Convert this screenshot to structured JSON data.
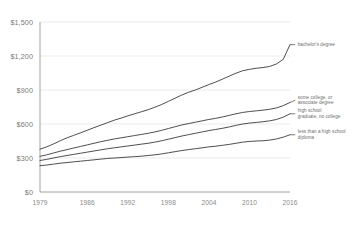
{
  "chart_data": {
    "type": "line",
    "title": "",
    "subtitle": "",
    "xlabel": "",
    "ylabel": "",
    "grid": true,
    "legend_position": "inline-right",
    "xlim": [
      1979,
      2016
    ],
    "ylim": [
      0,
      1500
    ],
    "y_ticks": [
      0,
      300,
      600,
      900,
      1200,
      1500
    ],
    "y_tick_labels": [
      "$0",
      "$300",
      "$600",
      "$900",
      "$1,200",
      "$1,500"
    ],
    "x_ticks": [
      1979,
      1986,
      1992,
      1998,
      2004,
      2010,
      2016
    ],
    "x_tick_labels": [
      "1979",
      "1986",
      "1992",
      "1998",
      "2004",
      "2010",
      "2016"
    ],
    "x": [
      1979,
      1980,
      1981,
      1982,
      1983,
      1984,
      1985,
      1986,
      1987,
      1988,
      1989,
      1990,
      1991,
      1992,
      1993,
      1994,
      1995,
      1996,
      1997,
      1998,
      1999,
      2000,
      2001,
      2002,
      2003,
      2004,
      2005,
      2006,
      2007,
      2008,
      2009,
      2010,
      2011,
      2012,
      2013,
      2014,
      2015,
      2016
    ],
    "series": [
      {
        "name": "bachelor's degree",
        "label": "bachelor's degree",
        "color": "#3a3a3a",
        "label_x": 2017.0,
        "label_y": 1300,
        "values": [
          378,
          398,
          424,
          452,
          478,
          500,
          522,
          545,
          568,
          590,
          612,
          634,
          652,
          672,
          690,
          708,
          726,
          748,
          772,
          800,
          828,
          856,
          880,
          900,
          924,
          948,
          970,
          996,
          1022,
          1048,
          1070,
          1082,
          1092,
          1098,
          1108,
          1130,
          1170,
          1300
        ]
      },
      {
        "name": "some college, or associate degree",
        "label": "some college, or associate degree",
        "color": "#3a3a3a",
        "label_x": 2017.0,
        "label_y": 810,
        "values": [
          315,
          328,
          344,
          360,
          374,
          388,
          402,
          416,
          430,
          444,
          456,
          468,
          478,
          488,
          498,
          508,
          518,
          530,
          544,
          560,
          576,
          592,
          604,
          616,
          628,
          640,
          650,
          662,
          676,
          690,
          702,
          710,
          716,
          722,
          730,
          742,
          762,
          790
        ]
      },
      {
        "name": "high school graduate, no college",
        "label": "high school graduate, no college",
        "color": "#3a3a3a",
        "label_x": 2017.0,
        "label_y": 690,
        "values": [
          278,
          288,
          300,
          312,
          322,
          332,
          342,
          352,
          362,
          372,
          382,
          390,
          398,
          406,
          414,
          422,
          430,
          440,
          452,
          466,
          480,
          494,
          506,
          518,
          530,
          542,
          552,
          562,
          574,
          588,
          600,
          608,
          614,
          620,
          628,
          640,
          660,
          690
        ]
      },
      {
        "name": "less than a high school diploma",
        "label": "less than a high school diploma",
        "color": "#3a3a3a",
        "label_x": 2017.0,
        "label_y": 505,
        "values": [
          232,
          238,
          246,
          254,
          260,
          266,
          272,
          278,
          284,
          290,
          296,
          300,
          304,
          308,
          312,
          316,
          322,
          328,
          336,
          346,
          356,
          366,
          374,
          382,
          390,
          398,
          404,
          412,
          420,
          430,
          440,
          446,
          450,
          452,
          458,
          468,
          484,
          505
        ]
      }
    ]
  }
}
